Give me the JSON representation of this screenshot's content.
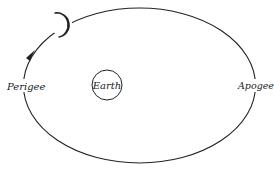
{
  "diagram": {
    "labels": {
      "perigee": "Perigee",
      "apogee": "Apogee",
      "earth": "Earth"
    },
    "icons": [
      "moon-crescent-icon",
      "direction-arrow-icon"
    ],
    "colors": {
      "stroke": "#222222",
      "background": "#ffffff"
    }
  }
}
